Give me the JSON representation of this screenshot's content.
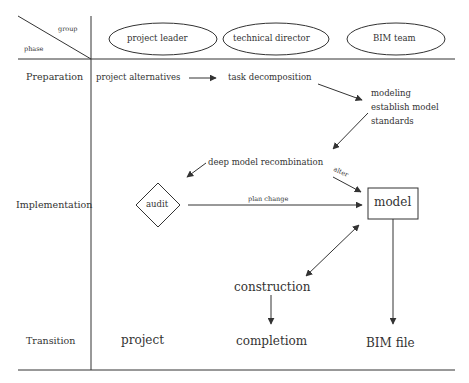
{
  "header": {
    "corner_top": "group",
    "corner_bottom": "phase",
    "groups": [
      "project leader",
      "technical director",
      "BIM  team"
    ]
  },
  "phases": [
    "Preparation",
    "Implementation",
    "Transition"
  ],
  "nodes": {
    "project_alternatives": "project alternatives",
    "task_decomposition": "task decomposition",
    "modeling": "modeling",
    "establish_model": "establish model",
    "standards": "standards",
    "deep_model_recombination": "deep model recombination",
    "alter": "alter",
    "audit": "audit",
    "plan_change": "plan change",
    "model": "model",
    "construction": "construction",
    "project": "project",
    "completiom": "completiom",
    "bim_file": "BIM file"
  },
  "colors": {
    "line": "#333333",
    "background": "#ffffff"
  }
}
